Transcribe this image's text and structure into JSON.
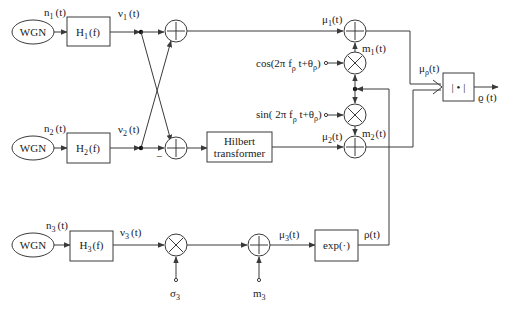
{
  "diagram": {
    "title": "",
    "colors": {
      "line": "#3a3a3a",
      "text": "#222222",
      "background": "#ffffff"
    },
    "sources": [
      {
        "id": "wgn1",
        "label": "WGN",
        "output": "n_1 (t)"
      },
      {
        "id": "wgn2",
        "label": "WGN",
        "output": "n_2 (t)"
      },
      {
        "id": "wgn3",
        "label": "WGN",
        "output": "n_3 (t)"
      }
    ],
    "filters": [
      {
        "id": "h1",
        "label": "H₁(f)",
        "output": "ν₁ (t)"
      },
      {
        "id": "h2",
        "label": "H₂(f)",
        "output": "ν₂ (t)"
      },
      {
        "id": "h3",
        "label": "H₃(f)",
        "output": "ν₃ (t)"
      }
    ],
    "labels": {
      "n1": "n",
      "n1_sub": "1",
      "n1_t": "(t)",
      "n2": "n",
      "n2_sub": "2",
      "n2_t": "(t)",
      "n3": "n",
      "n3_sub": "3",
      "n3_t": "(t)",
      "v1": "ν",
      "v1_sub": "1",
      "v1_t": "(t)",
      "v2": "ν",
      "v2_sub": "2",
      "v2_t": "(t)",
      "v3": "ν",
      "v3_sub": "3",
      "v3_t": "(t)",
      "h1": "H",
      "h1_sub": "1",
      "h1_f": "(f)",
      "h2": "H",
      "h2_sub": "2",
      "h2_f": "(f)",
      "h3": "H",
      "h3_sub": "3",
      "h3_f": "(f)",
      "minus": "−",
      "hilbert_line1": "Hilbert",
      "hilbert_line2": "transformer",
      "mu1": "μ",
      "mu1_sub": "1",
      "mu1_t": "(t)",
      "mu2": "μ",
      "mu2_sub": "2",
      "mu2_t": "(t)",
      "mu3": "μ",
      "mu3_sub": "3",
      "mu3_t": "(t)",
      "m1": "m",
      "m1_sub": "1",
      "m1_t": "(t)",
      "m2": "m",
      "m2_sub": "2",
      "m2_t": "(t)",
      "cos_a": "cos(2π f",
      "cos_sub1": "ρ",
      "cos_b": " t+θ",
      "cos_sub2": "ρ",
      "cos_c": ")",
      "sin_a": "sin( 2π f",
      "sin_sub1": "ρ",
      "sin_b": " t+θ",
      "sin_sub2": "ρ",
      "sin_c": ")",
      "mu_rho": "μ",
      "mu_rho_sub": "ρ",
      "mu_rho_t": "(t)",
      "abs_block": "| • |",
      "varrho": "ϱ (t)",
      "exp_block": "exp(·)",
      "rho": "ρ(t)",
      "sigma3": "σ",
      "sigma3_sub": "3",
      "m3": "m",
      "m3_sub": "3"
    },
    "operators": [
      {
        "id": "sum-top",
        "type": "adder",
        "inputs": [
          "ν₁(t)",
          "ν₂(t)"
        ],
        "output": "μ₁(t)"
      },
      {
        "id": "sum-bottom",
        "type": "adder",
        "inputs": [
          "ν₁(t)",
          "−ν₂(t)"
        ],
        "output": "→ Hilbert transformer"
      },
      {
        "id": "mult-cos",
        "type": "multiplier",
        "inputs": [
          "ρ(t)",
          "cos(2π f_ρ t+θ_ρ)"
        ],
        "output": "m₁(t)"
      },
      {
        "id": "mult-sin",
        "type": "multiplier",
        "inputs": [
          "ρ(t)",
          "sin(2π f_ρ t+θ_ρ)"
        ],
        "output": "m₂(t)"
      },
      {
        "id": "sum-mu1",
        "type": "adder",
        "inputs": [
          "μ₁(t)",
          "m₁(t)"
        ]
      },
      {
        "id": "sum-mu2",
        "type": "adder",
        "inputs": [
          "μ₂(t)",
          "m₂(t)"
        ]
      },
      {
        "id": "mult-sigma3",
        "type": "multiplier",
        "inputs": [
          "ν₃(t)",
          "σ₃"
        ]
      },
      {
        "id": "sum-m3",
        "type": "adder",
        "inputs": [
          "σ₃ν₃(t)",
          "m₃"
        ],
        "output": "μ₃(t)"
      },
      {
        "id": "exp",
        "type": "block",
        "input": "μ₃(t)",
        "output": "ρ(t)"
      },
      {
        "id": "abs",
        "type": "block",
        "input": "μ_ρ(t)",
        "output": "ϱ(t)"
      }
    ]
  }
}
